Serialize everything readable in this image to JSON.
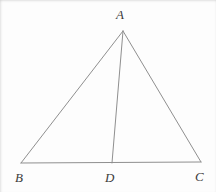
{
  "figure": {
    "kind": "geometry-diagram",
    "width": 216,
    "height": 192,
    "background_color": "#fdfdfd",
    "line_color": "#8f8f8f",
    "label_color": "#3b3b3b",
    "line_width": 1,
    "points": {
      "A": {
        "label": "A",
        "x": 123,
        "y": 31,
        "label_x": 116,
        "label_y": 8
      },
      "B": {
        "label": "B",
        "x": 21,
        "y": 163,
        "label_x": 15,
        "label_y": 171
      },
      "C": {
        "label": "C",
        "x": 201,
        "y": 162,
        "label_x": 195,
        "label_y": 170
      },
      "D": {
        "label": "D",
        "x": 112,
        "y": 163,
        "label_x": 105,
        "label_y": 171
      }
    },
    "segments": [
      {
        "name": "side-AB",
        "from": "A",
        "to": "B"
      },
      {
        "name": "side-AC",
        "from": "A",
        "to": "C"
      },
      {
        "name": "side-BC",
        "from": "B",
        "to": "C"
      },
      {
        "name": "cevian-AD",
        "from": "A",
        "to": "D"
      }
    ]
  }
}
